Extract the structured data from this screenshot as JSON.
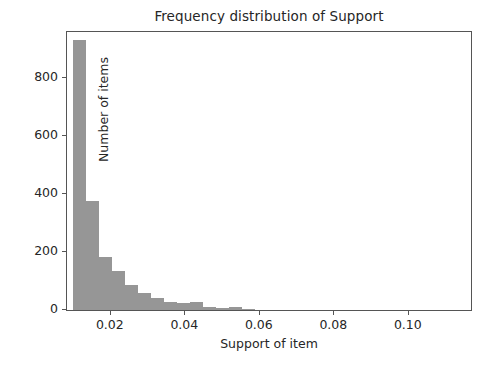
{
  "chart_data": {
    "type": "bar",
    "title": "Frequency distribution of Support",
    "xlabel": "Support of item",
    "ylabel": "Number of items",
    "xlim": [
      0.0085,
      0.1175
    ],
    "ylim": [
      0,
      965
    ],
    "grid": false,
    "legend": null,
    "bar_color": "#969696",
    "bin_width": 0.0035,
    "xticks": [
      0.02,
      0.04,
      0.06,
      0.08,
      0.1
    ],
    "xtick_labels": [
      "0.02",
      "0.04",
      "0.06",
      "0.08",
      "0.10"
    ],
    "yticks": [
      0,
      200,
      400,
      600,
      800
    ],
    "ytick_labels": [
      "0",
      "200",
      "400",
      "600",
      "800"
    ],
    "bin_starts": [
      0.01,
      0.0135,
      0.017,
      0.0205,
      0.024,
      0.0275,
      0.031,
      0.0345,
      0.038,
      0.0415,
      0.045,
      0.0485,
      0.052,
      0.0555
    ],
    "bin_centers": [
      0.01175,
      0.01525,
      0.01875,
      0.02225,
      0.02575,
      0.02925,
      0.03275,
      0.03625,
      0.03975,
      0.04325,
      0.04675,
      0.05025,
      0.05375,
      0.05725
    ],
    "values": [
      930,
      375,
      183,
      134,
      86,
      57,
      42,
      26,
      24,
      28,
      10,
      8,
      9,
      3
    ]
  },
  "axes": {
    "frame_color": "#555555"
  }
}
